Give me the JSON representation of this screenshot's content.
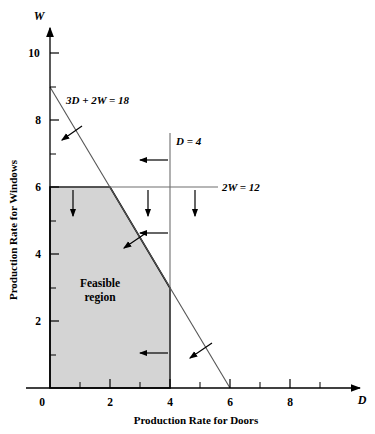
{
  "figure": {
    "name": "wyndor-feasible-region-graph",
    "axes": {
      "x": {
        "name": "D",
        "title": "Production Rate for Doors",
        "tick_labels": [
          "0",
          "2",
          "4",
          "6",
          "8"
        ],
        "tick_values": [
          0,
          2,
          4,
          6,
          8
        ],
        "minor_tick_values": [
          1,
          3,
          5,
          7,
          9
        ],
        "range": [
          0,
          10
        ]
      },
      "y": {
        "name": "W",
        "title": "Production Rate for Windows",
        "tick_labels": [
          "2",
          "4",
          "6",
          "8",
          "10"
        ],
        "tick_values": [
          2,
          4,
          6,
          8,
          10
        ],
        "minor_tick_values": [
          1,
          3,
          5,
          7,
          9,
          11
        ],
        "range": [
          0,
          11
        ]
      }
    },
    "constraints": [
      {
        "id": "diagonal",
        "label": "3D + 2W = 18",
        "from": [
          0,
          9
        ],
        "to": [
          6,
          0
        ]
      },
      {
        "id": "vertical",
        "label": "D = 4",
        "from": [
          4,
          0
        ],
        "to": [
          4,
          7.6
        ]
      },
      {
        "id": "horizontal",
        "label": "2W = 12",
        "from": [
          0,
          6
        ],
        "to": [
          5.6,
          6
        ]
      }
    ],
    "feasible_region": {
      "label_line1": "Feasible",
      "label_line2": "region",
      "vertices": [
        [
          0,
          0
        ],
        [
          0,
          6
        ],
        [
          2,
          6
        ],
        [
          4,
          3
        ],
        [
          4,
          0
        ]
      ],
      "fill_color": "#d4d4d4"
    },
    "colors": {
      "axis": "#000000",
      "constraint_line": "#555555",
      "region_border": "#000000",
      "region_fill": "#d4d4d4",
      "arrow": "#000000"
    }
  }
}
